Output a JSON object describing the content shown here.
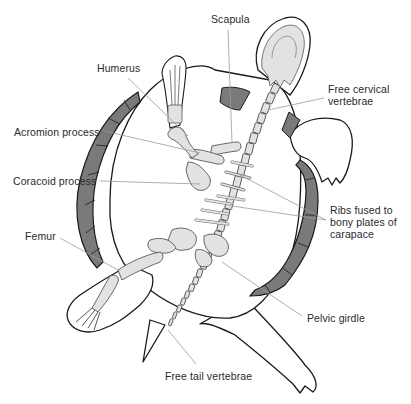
{
  "diagram": {
    "colors": {
      "background": "#ffffff",
      "carapace_shell": "#7a7a7a",
      "bone_fill": "#e2e2e2",
      "outline": "#1a1a1a",
      "leader_line": "#9a9a9a",
      "label_text": "#2a2a2a"
    },
    "labels": [
      {
        "id": "scapula",
        "text": "Scapula",
        "x": 211,
        "y": 13
      },
      {
        "id": "humerus",
        "text": "Humerus",
        "x": 97,
        "y": 62
      },
      {
        "id": "free-cervical-vertebrae",
        "text": "Free cervical\nvertebrae",
        "x": 328,
        "y": 83
      },
      {
        "id": "acromion-process",
        "text": "Acromion process",
        "x": 14,
        "y": 126
      },
      {
        "id": "coracoid-process",
        "text": "Coracoid process",
        "x": 13,
        "y": 175
      },
      {
        "id": "ribs-fused",
        "text": "Ribs fused to\nbony plates of\ncarapace",
        "x": 330,
        "y": 204
      },
      {
        "id": "femur",
        "text": "Femur",
        "x": 25,
        "y": 230
      },
      {
        "id": "pelvic-girdle",
        "text": "Pelvic girdle",
        "x": 307,
        "y": 312
      },
      {
        "id": "free-tail-vertebrae",
        "text": "Free tail vertebrae",
        "x": 165,
        "y": 370
      }
    ]
  }
}
